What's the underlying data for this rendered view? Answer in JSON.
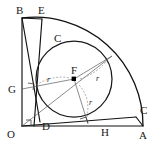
{
  "figure": {
    "background_color": "#ffffff",
    "line_color": "#111111",
    "thin_line_color": "#5a5a5a",
    "dash_color": "#777777",
    "width": 154,
    "height": 143,
    "points": {
      "O": {
        "label": "O",
        "x": 22,
        "y": 126,
        "label_x": 9,
        "label_y": 137
      },
      "A": {
        "label": "A",
        "x": 143,
        "y": 126,
        "label_x": 140,
        "label_y": 138
      },
      "B": {
        "label": "B",
        "x": 22,
        "y": 18,
        "label_x": 16,
        "label_y": 14
      },
      "E": {
        "label": "E",
        "x": 42,
        "y": 19,
        "label_x": 38,
        "label_y": 14
      },
      "C_arc": {
        "label": "C",
        "x": 57,
        "y": 43,
        "label_x": 54,
        "label_y": 42
      },
      "C_edge": {
        "label": "C",
        "x": 136,
        "y": 117,
        "label_x": 140,
        "label_y": 114
      },
      "D": {
        "label": "D",
        "x": 40,
        "y": 121,
        "label_x": 42,
        "label_y": 129
      },
      "F": {
        "label": "F",
        "x": 74,
        "y": 79,
        "label_x": 71,
        "label_y": 74
      },
      "G": {
        "label": "G",
        "x": 22,
        "y": 89,
        "label_x": 8,
        "label_y": 93
      },
      "H": {
        "label": "H",
        "x": 88,
        "y": 126,
        "label_x": 101,
        "label_y": 135
      }
    },
    "radius_labels": [
      {
        "text": "r",
        "x": 47,
        "y": 82,
        "name": "radius-label-left"
      },
      {
        "text": "r",
        "x": 97,
        "y": 81,
        "name": "radius-label-upper-right"
      },
      {
        "text": "r",
        "x": 90,
        "y": 105,
        "name": "radius-label-lower"
      }
    ],
    "circle": {
      "center_x": 74,
      "center_y": 79,
      "radius": 38
    },
    "quarter_arc": {
      "center_x": 22,
      "center_y": 126,
      "radius": 121
    }
  }
}
